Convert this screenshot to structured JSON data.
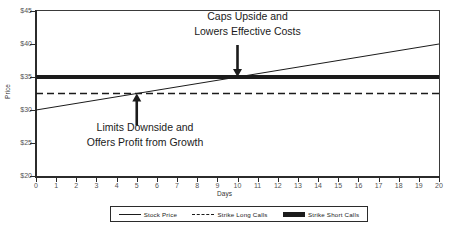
{
  "chart_data": {
    "type": "line",
    "title": "",
    "xlabel": "Days",
    "ylabel": "Price",
    "xlim": [
      0,
      20
    ],
    "ylim": [
      20,
      45
    ],
    "grid": false,
    "legend_position": "bottom",
    "x_ticks": [
      "0",
      "1",
      "2",
      "3",
      "4",
      "5",
      "6",
      "7",
      "8",
      "9",
      "10",
      "11",
      "12",
      "13",
      "14",
      "15",
      "16",
      "17",
      "18",
      "19",
      "20"
    ],
    "y_ticks": [
      "$20",
      "$25",
      "$30",
      "$35",
      "$40",
      "$45"
    ],
    "x": [
      0,
      20
    ],
    "series": [
      {
        "name": "Stock Price",
        "style": "solid-thin",
        "color": "#1b1b1b",
        "values": [
          30,
          40
        ]
      },
      {
        "name": "Strike Long Calls",
        "style": "dashed",
        "color": "#1b1b1b",
        "values": [
          32.5,
          32.5
        ]
      },
      {
        "name": "Strike Short Calls",
        "style": "solid-thick",
        "color": "#1b1b1b",
        "values": [
          35,
          35
        ]
      }
    ],
    "annotations": [
      {
        "id": "upper",
        "line1": "Caps Upside and",
        "line2": "Lowers Effective Costs",
        "arrow": "down",
        "points_to_x": 10,
        "points_to_y": 35
      },
      {
        "id": "lower",
        "line1": "Limits Downside and",
        "line2": "Offers Profit from Growth",
        "arrow": "up",
        "points_to_x": 5,
        "points_to_y": 32.5
      }
    ]
  },
  "legend": {
    "items": [
      {
        "label": "Stock Price",
        "style": "solid-thin"
      },
      {
        "label": "Strike Long Calls",
        "style": "dashed"
      },
      {
        "label": "Strike Short Calls",
        "style": "solid-thick"
      }
    ]
  },
  "axes": {
    "x_title": "Days",
    "y_title": "Price"
  }
}
